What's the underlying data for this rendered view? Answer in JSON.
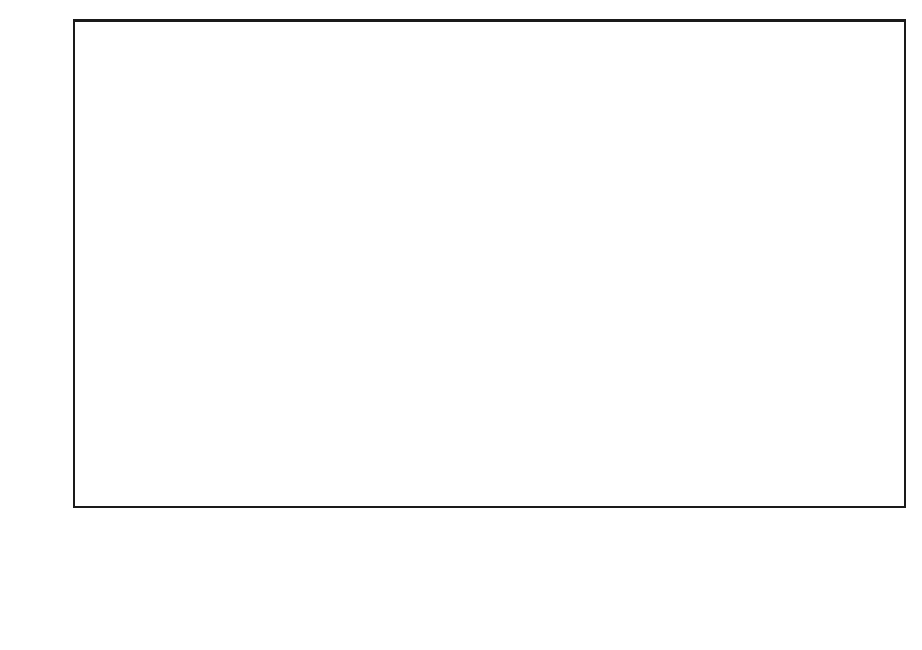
{
  "chart_data": {
    "type": "bar",
    "title": "",
    "subtitle": "",
    "xlabel": "",
    "ylabel": "",
    "ylim": [
      0,
      80
    ],
    "ytick_values": [
      0,
      10,
      20,
      30,
      40,
      50,
      60,
      70,
      80
    ],
    "ytick_labels": [
      "0%",
      "10%",
      "20%",
      "30%",
      "40%",
      "50%",
      "60%",
      "70%",
      "80%"
    ],
    "grid": false,
    "legend_position": "bottom",
    "categories": [
      "Overall",
      "North\nAmerica",
      "Europe",
      "Asia Pacific",
      "Brazil",
      "South Africa"
    ],
    "series": [
      {
        "name": "Increase",
        "color": "#c8c8c8",
        "values": [
          68,
          68,
          43,
          72,
          73,
          61
        ]
      },
      {
        "name": "Stay the same",
        "color": "#c8c8c8",
        "values": [
          24,
          31,
          29.5,
          18,
          15,
          22
        ]
      },
      {
        "name": "Decrease",
        "color": "#6e6e6e",
        "values": [
          17,
          11,
          27,
          19,
          11,
          11
        ]
      }
    ]
  },
  "axis": {
    "y_labels": [
      "80%",
      "70%",
      "60%",
      "50%",
      "40%",
      "30%",
      "20%",
      "10%",
      "0%"
    ]
  },
  "legend": {
    "items": [
      {
        "label": "Increase",
        "shade": "light"
      },
      {
        "label": "Stay the same",
        "shade": "light"
      },
      {
        "label": "Decrease",
        "shade": "dark"
      }
    ]
  }
}
